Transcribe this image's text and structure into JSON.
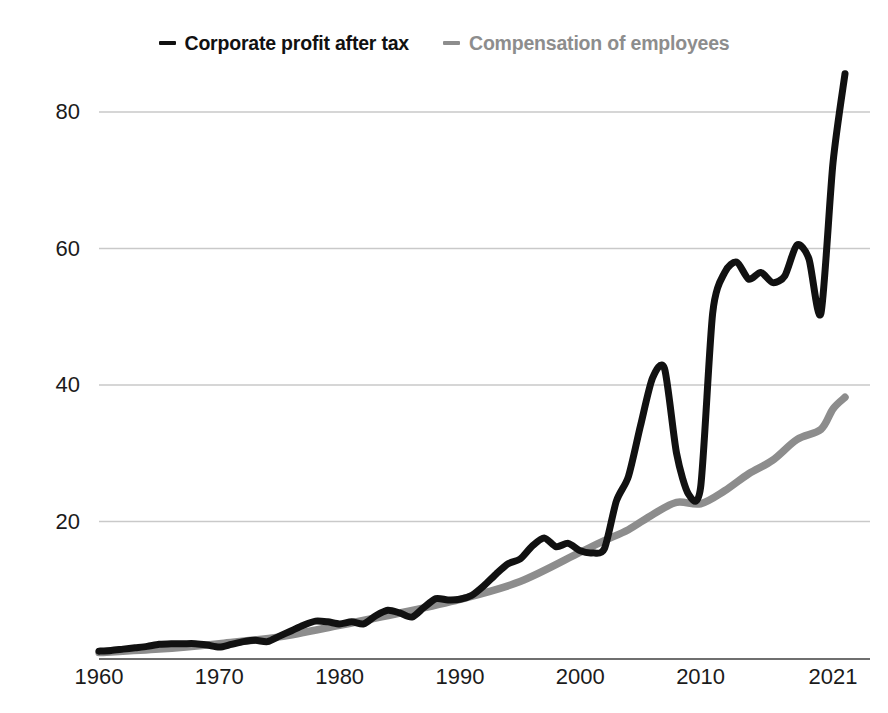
{
  "legend": {
    "items": [
      {
        "label": "Corporate profit after tax",
        "color": "#111111",
        "icon": "dash-icon"
      },
      {
        "label": "Compensation of employees",
        "color": "#8d8d8d",
        "icon": "dash-icon"
      }
    ]
  },
  "axes": {
    "y_ticks": [
      "20",
      "40",
      "60",
      "80"
    ],
    "x_ticks": [
      "1960",
      "1970",
      "1980",
      "1990",
      "2000",
      "2010",
      "2021"
    ]
  },
  "chart_data": {
    "type": "line",
    "title": "",
    "subtitle": "",
    "xlabel": "",
    "ylabel": "",
    "xlim": [
      1960,
      2022
    ],
    "ylim": [
      0,
      90
    ],
    "grid": "horizontal",
    "legend_position": "top-center",
    "axis_baseline_value": 0,
    "y_ticks": [
      20,
      40,
      60,
      80
    ],
    "x_ticks": [
      1960,
      1970,
      1980,
      1990,
      2000,
      2010,
      2021
    ],
    "series": [
      {
        "name": "Corporate profit after tax",
        "color": "#111111",
        "x": [
          1960,
          1961,
          1962,
          1963,
          1964,
          1965,
          1966,
          1967,
          1968,
          1969,
          1970,
          1971,
          1972,
          1973,
          1974,
          1975,
          1976,
          1977,
          1978,
          1979,
          1980,
          1981,
          1982,
          1983,
          1984,
          1985,
          1986,
          1987,
          1988,
          1989,
          1990,
          1991,
          1992,
          1993,
          1994,
          1995,
          1996,
          1997,
          1998,
          1999,
          2000,
          2001,
          2002,
          2003,
          2004,
          2005,
          2006,
          2007,
          2008,
          2009,
          2010,
          2011,
          2012,
          2013,
          2014,
          2015,
          2016,
          2017,
          2018,
          2019,
          2020,
          2021,
          2022
        ],
        "values": [
          1.0,
          1.1,
          1.3,
          1.5,
          1.7,
          2.0,
          2.1,
          2.1,
          2.1,
          1.9,
          1.6,
          2.0,
          2.4,
          2.6,
          2.4,
          3.2,
          4.0,
          4.8,
          5.4,
          5.3,
          5.0,
          5.3,
          5.0,
          6.2,
          7.0,
          6.6,
          6.0,
          7.4,
          8.7,
          8.5,
          8.6,
          9.2,
          10.6,
          12.3,
          13.8,
          14.5,
          16.4,
          17.6,
          16.3,
          16.8,
          15.7,
          15.4,
          16.0,
          23.0,
          26.6,
          34.0,
          41.0,
          42.4,
          30.0,
          24.0,
          25.0,
          50.5,
          56.5,
          58.0,
          55.5,
          56.5,
          55.0,
          56.0,
          60.5,
          58.5,
          50.5,
          72.5,
          85.6
        ]
      },
      {
        "name": "Compensation of employees",
        "color": "#8d8d8d",
        "x": [
          1960,
          1965,
          1970,
          1975,
          1980,
          1985,
          1990,
          1995,
          2000,
          2002,
          2004,
          2006,
          2008,
          2010,
          2012,
          2014,
          2016,
          2018,
          2020,
          2021,
          2022
        ],
        "values": [
          0.8,
          1.3,
          2.1,
          3.1,
          4.8,
          6.6,
          8.6,
          11.2,
          15.5,
          17.2,
          18.8,
          21.0,
          22.8,
          22.6,
          24.5,
          27.0,
          29.0,
          32.0,
          33.5,
          36.5,
          38.2
        ]
      }
    ]
  }
}
